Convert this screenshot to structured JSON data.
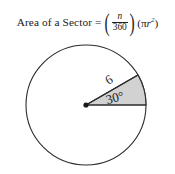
{
  "formula": {
    "lead": "Area of a Sector",
    "equals": "=",
    "open_paren": "(",
    "numerator": "n",
    "denominator": "360",
    "close_paren": ")",
    "pi_open": "(",
    "pi": "π",
    "radius_var": "r",
    "exponent": "2",
    "pi_close": ")"
  },
  "diagram": {
    "radius_label": "6",
    "angle_label": "30°",
    "circle": {
      "center_x": 86,
      "center_y": 67,
      "radius": 60,
      "stroke": "#2b2b2b",
      "stroke_width": 1.1,
      "fill": "#ffffff"
    },
    "sector": {
      "start_angle_deg": 0,
      "end_angle_deg": 30,
      "fill": "#d2d2d2",
      "stroke": "#2b2b2b",
      "stroke_width": 1.1
    },
    "center_dot": {
      "radius": 2.6,
      "fill": "#1a1a1a"
    }
  },
  "colors": {
    "background": "#ffffff",
    "ink": "#1a1a1a",
    "sector_fill": "#d2d2d2",
    "stroke": "#2b2b2b"
  }
}
